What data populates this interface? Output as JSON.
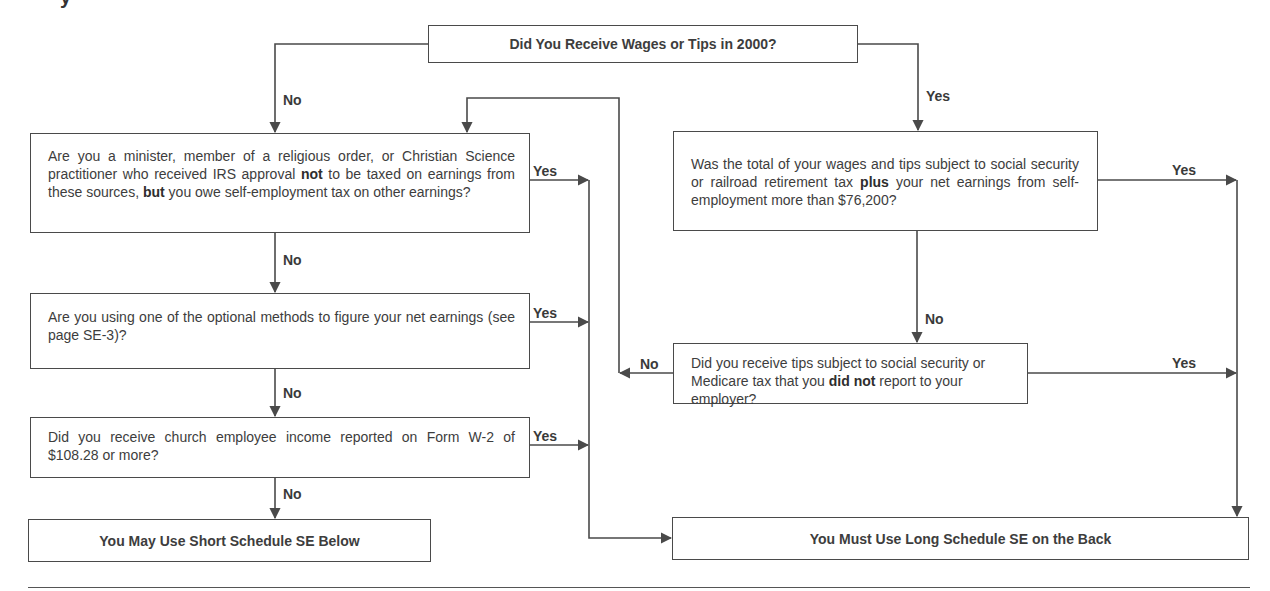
{
  "flowchart": {
    "start": {
      "text": "Did You Receive Wages or Tips in 2000?"
    },
    "q_minister": {
      "parts": [
        "Are you a minister, member of a religious order, or Christian Science practitioner who received IRS approval ",
        "not",
        " to be taxed on earnings from these sources, ",
        "but",
        " you owe self-employment tax on other earnings?"
      ]
    },
    "q_optional": {
      "text": "Are you using one of the optional methods to figure your net earnings (see page SE-3)?"
    },
    "q_church": {
      "text": "Did you receive church employee income reported on Form W-2 of $108.28 or more?"
    },
    "q_wages_total": {
      "parts": [
        "Was the total of your wages and tips subject to social security or railroad retirement tax ",
        "plus",
        " your net earnings from self-employment more than $76,200?"
      ]
    },
    "q_tips": {
      "parts": [
        "Did you receive tips subject to social security or Medicare tax that you ",
        "did not",
        " report to your employer?"
      ]
    },
    "result_short": {
      "text": "You May Use Short Schedule SE Below"
    },
    "result_long": {
      "text": "You Must Use Long Schedule SE on the Back"
    },
    "labels": {
      "yes": "Yes",
      "no": "No"
    }
  },
  "colors": {
    "line": "#4a4a4a",
    "text": "#3a3a3a",
    "background": "#ffffff"
  }
}
